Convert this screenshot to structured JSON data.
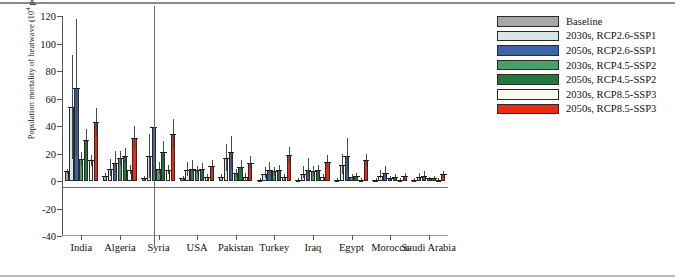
{
  "chart_data": {
    "type": "bar",
    "title": "",
    "xlabel": "",
    "ylabel": "Population mortality of heatwave (10^4 person)",
    "ylabel_html": "Population mortality of heatwave (10<sup>4</sup> person)",
    "ylim": [
      -40,
      120
    ],
    "yticks": [
      -40,
      -20,
      0,
      20,
      40,
      60,
      80,
      100,
      120
    ],
    "ytick_labels": [
      "-40",
      "-20",
      "0",
      "20",
      "40",
      "60",
      "80",
      "100",
      "120"
    ],
    "grid": false,
    "legend_position": "top-right",
    "categories": [
      "India",
      "Algeria",
      "Syria",
      "USA",
      "Pakistan",
      "Turkey",
      "Iraq",
      "Egypt",
      "Morocco",
      "Saudi Arabia"
    ],
    "series": [
      {
        "name": "Baseline",
        "color": "#a8a8a8",
        "values": [
          7,
          4,
          2,
          2,
          3,
          1,
          1,
          1,
          1,
          1
        ],
        "err_low": [
          5,
          3,
          1,
          1,
          2,
          0.5,
          0.5,
          0.5,
          0.5,
          0.5
        ],
        "err_high": [
          9,
          6,
          4,
          4,
          5,
          2,
          2,
          2,
          2,
          2
        ]
      },
      {
        "name": "2030s, RCP2.6-SSP1",
        "color": "#d8e6e4",
        "values": [
          54,
          9,
          18,
          8,
          17,
          5,
          5,
          12,
          4,
          3
        ],
        "err_low": [
          16,
          4,
          2,
          4,
          7,
          2,
          2,
          5,
          2,
          1
        ],
        "err_high": [
          92,
          16,
          34,
          14,
          27,
          10,
          11,
          20,
          8,
          6
        ]
      },
      {
        "name": "2050s, RCP2.6-SSP1",
        "color": "#3a66a8",
        "values": [
          68,
          13,
          39,
          9,
          21,
          8,
          8,
          18,
          6,
          4
        ],
        "err_low": [
          18,
          6,
          3,
          5,
          9,
          3,
          3,
          8,
          3,
          2
        ],
        "err_high": [
          118,
          22,
          76,
          15,
          33,
          14,
          17,
          31,
          11,
          7
        ]
      },
      {
        "name": "2030s, RCP4.5-SSP2",
        "color": "#4d9e66",
        "values": [
          16,
          17,
          9,
          8,
          6,
          7,
          7,
          3,
          2,
          2
        ],
        "err_low": [
          11,
          12,
          5,
          5,
          3,
          4,
          4,
          1,
          1,
          1
        ],
        "err_high": [
          21,
          22,
          14,
          11,
          9,
          10,
          11,
          5,
          4,
          3
        ]
      },
      {
        "name": "2050s, RCP4.5-SSP2",
        "color": "#1e7a3c",
        "values": [
          30,
          18,
          21,
          9,
          10,
          8,
          8,
          4,
          3,
          2
        ],
        "err_low": [
          22,
          13,
          13,
          6,
          6,
          5,
          5,
          2,
          1,
          1
        ],
        "err_high": [
          38,
          24,
          29,
          13,
          15,
          12,
          12,
          6,
          5,
          4
        ]
      },
      {
        "name": "2030s, RCP8.5-SSP3",
        "color": "#fbfaf0",
        "values": [
          15,
          8,
          8,
          3,
          3,
          3,
          3,
          1,
          1,
          1
        ],
        "err_low": [
          11,
          5,
          5,
          1,
          1,
          1,
          1,
          0.5,
          0.5,
          0.5
        ],
        "err_high": [
          19,
          12,
          12,
          5,
          6,
          5,
          5,
          2,
          2,
          2
        ]
      },
      {
        "name": "2050s, RCP8.5-SSP3",
        "color": "#f02713",
        "values": [
          43,
          31,
          34,
          11,
          13,
          19,
          14,
          15,
          4,
          5
        ],
        "err_low": [
          33,
          23,
          24,
          8,
          9,
          13,
          10,
          11,
          2,
          3
        ],
        "err_high": [
          53,
          40,
          45,
          15,
          18,
          25,
          19,
          20,
          6,
          7
        ]
      }
    ]
  },
  "legend": {
    "items": [
      {
        "label": "Baseline"
      },
      {
        "label": "2030s, RCP2.6-SSP1"
      },
      {
        "label": "2050s, RCP2.6-SSP1"
      },
      {
        "label": "2030s, RCP4.5-SSP2"
      },
      {
        "label": "2050s, RCP4.5-SSP2"
      },
      {
        "label": "2030s, RCP8.5-SSP3"
      },
      {
        "label": "2050s, RCP8.5-SSP3"
      }
    ]
  }
}
